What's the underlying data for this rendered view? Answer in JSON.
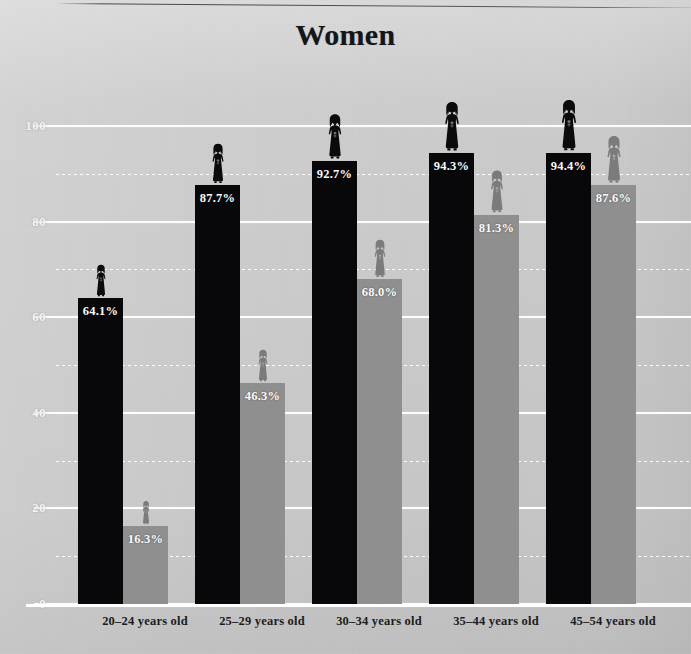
{
  "title": "Women",
  "chart_data": {
    "type": "bar",
    "title": "Women",
    "xlabel": "",
    "ylabel": "",
    "ylim": [
      0,
      100
    ],
    "yticks": [
      0,
      20,
      40,
      60,
      80,
      100
    ],
    "ytick_labels": [
      "0",
      "20",
      "40",
      "60",
      "80",
      "100"
    ],
    "minor_yticks": [
      10,
      30,
      50,
      70,
      90
    ],
    "grid": true,
    "legend_position": "none",
    "value_label_suffix": "%",
    "categories": [
      "20–24 years old",
      "25–29 years old",
      "30–34 years old",
      "35–44 years old",
      "45–54 years old"
    ],
    "series": [
      {
        "name": "dark",
        "color": "#08080a",
        "values": [
          64.1,
          87.7,
          92.7,
          94.3,
          94.4
        ],
        "labels": [
          "64.1%",
          "87.7%",
          "92.7%",
          "94.3%",
          "94.4%"
        ]
      },
      {
        "name": "light",
        "color": "#8f8f8f",
        "values": [
          16.3,
          46.3,
          68.0,
          81.3,
          87.6
        ],
        "labels": [
          "16.3%",
          "46.3%",
          "68.0%",
          "81.3%",
          "87.6%"
        ]
      }
    ]
  },
  "colors": {
    "background": "#cdcdcd",
    "dark_bar": "#08080a",
    "light_bar": "#8f8f8f",
    "dark_figure": "#0b0b0d",
    "light_figure": "#7b7b7b",
    "gridline": "#fdfdfd",
    "axis": "#ffffff",
    "value_text": "#fbfbfb",
    "ytick_text": "#f4f4f4",
    "xtick_text": "#1b1c20",
    "title_text": "#15161a"
  },
  "icons": {
    "figure": "woman-figure-icon"
  }
}
